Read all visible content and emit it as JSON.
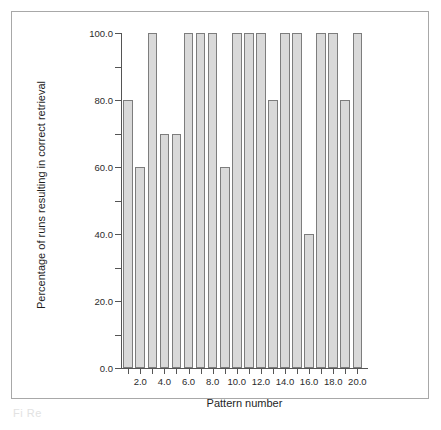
{
  "figure": {
    "caption_fragment": "Fi     Re"
  },
  "chart_data": {
    "type": "bar",
    "title": "",
    "xlabel": "Pattern number",
    "ylabel": "Percentage of runs resulting in correct retrieval",
    "categories": [
      1,
      2,
      3,
      4,
      5,
      6,
      7,
      8,
      9,
      10,
      11,
      12,
      13,
      14,
      15,
      16,
      17,
      18,
      19,
      20
    ],
    "values": [
      80,
      60,
      100,
      70,
      70,
      100,
      100,
      100,
      60,
      100,
      100,
      100,
      80,
      100,
      100,
      40,
      100,
      100,
      80,
      100
    ],
    "xlim": [
      0.4,
      20.8
    ],
    "ylim": [
      0,
      100
    ],
    "grid": false,
    "legend": null,
    "bar_fill": "#d9d9d9",
    "bar_stroke": "#7d7d7d",
    "axis_color": "#555555",
    "x_tick_values": [
      1,
      2,
      3,
      4,
      5,
      6,
      7,
      8,
      9,
      10,
      11,
      12,
      13,
      14,
      15,
      16,
      17,
      18,
      19,
      20
    ],
    "x_tick_labels": [
      {
        "value": 2,
        "label": "2.0"
      },
      {
        "value": 4,
        "label": "4.0"
      },
      {
        "value": 6,
        "label": "6.0"
      },
      {
        "value": 8,
        "label": "8.0"
      },
      {
        "value": 10,
        "label": "10.0"
      },
      {
        "value": 12,
        "label": "12.0"
      },
      {
        "value": 14,
        "label": "14.0"
      },
      {
        "value": 16,
        "label": "16.0"
      },
      {
        "value": 18,
        "label": "18.0"
      },
      {
        "value": 20,
        "label": "20.0"
      }
    ],
    "y_major_ticks": [
      {
        "value": 0,
        "label": "0.0"
      },
      {
        "value": 20,
        "label": "20.0"
      },
      {
        "value": 40,
        "label": "40.0"
      },
      {
        "value": 60,
        "label": "60.0"
      },
      {
        "value": 80,
        "label": "80.0"
      },
      {
        "value": 100,
        "label": "100.0"
      }
    ],
    "y_minor_ticks": [
      10,
      30,
      50,
      70,
      90
    ]
  }
}
